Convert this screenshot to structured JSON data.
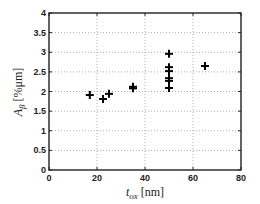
{
  "chart_data": {
    "type": "scatter",
    "title": "",
    "xlabel": "t_ox [nm]",
    "xlabel_parts": {
      "main": "t",
      "sub": "ox",
      "unit": " [nm]"
    },
    "ylabel": "A_β [%μm]",
    "ylabel_parts": {
      "main": "A",
      "sub": "β",
      "unit": " [%μm]"
    },
    "xlim": [
      0,
      80
    ],
    "ylim": [
      0,
      4
    ],
    "xticks": [
      0,
      20,
      40,
      60,
      80
    ],
    "yticks": [
      0,
      0.5,
      1,
      1.5,
      2,
      2.5,
      3,
      3.5,
      4
    ],
    "xtick_labels": [
      "0",
      "20",
      "40",
      "60",
      "80"
    ],
    "ytick_labels": [
      "0",
      "0.5",
      "1",
      "1.5",
      "2",
      "2.5",
      "3",
      "3.5",
      "4"
    ],
    "grid": true,
    "grid_style": "dotted",
    "marker": "+",
    "legend": null,
    "series": [
      {
        "name": "data",
        "points": [
          {
            "x": 17,
            "y": 1.91
          },
          {
            "x": 22.5,
            "y": 1.81
          },
          {
            "x": 25,
            "y": 1.94
          },
          {
            "x": 35,
            "y": 2.08
          },
          {
            "x": 35,
            "y": 2.12
          },
          {
            "x": 50,
            "y": 2.96
          },
          {
            "x": 50,
            "y": 2.62
          },
          {
            "x": 50,
            "y": 2.52
          },
          {
            "x": 50,
            "y": 2.34
          },
          {
            "x": 50,
            "y": 2.27
          },
          {
            "x": 50,
            "y": 2.09
          },
          {
            "x": 65,
            "y": 2.65
          }
        ]
      }
    ]
  },
  "colors": {
    "axis": "#222222",
    "grid": "#999999",
    "marker": "#000000"
  }
}
